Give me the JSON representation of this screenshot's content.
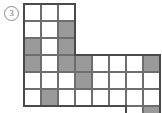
{
  "figure": {
    "label": "3",
    "label_name": "circled-figure-number",
    "type": "grid-polyomino-puzzle"
  },
  "grid": {
    "cell_size": 17,
    "origin_x": 24,
    "origin_y": 4,
    "columns": 8,
    "rows": 6,
    "line_color": "#6e6e6e",
    "outline_color": "#4a4a4a",
    "fill_color": "#9a9a9a",
    "empty_color": "#ffffff"
  },
  "chart_data": {
    "type": "heatmap",
    "title": "",
    "xlabel": "",
    "ylabel": "",
    "columns": 8,
    "rows": 6,
    "legend": [
      "empty",
      "shaded"
    ],
    "cells": [
      {
        "col": 0,
        "row": 0,
        "present": true,
        "filled": false
      },
      {
        "col": 1,
        "row": 0,
        "present": true,
        "filled": false
      },
      {
        "col": 2,
        "row": 0,
        "present": true,
        "filled": false
      },
      {
        "col": 3,
        "row": 0,
        "present": false,
        "filled": false
      },
      {
        "col": 4,
        "row": 0,
        "present": false,
        "filled": false
      },
      {
        "col": 5,
        "row": 0,
        "present": false,
        "filled": false
      },
      {
        "col": 6,
        "row": 0,
        "present": false,
        "filled": false
      },
      {
        "col": 7,
        "row": 0,
        "present": false,
        "filled": false
      },
      {
        "col": 0,
        "row": 1,
        "present": true,
        "filled": false
      },
      {
        "col": 1,
        "row": 1,
        "present": true,
        "filled": false
      },
      {
        "col": 2,
        "row": 1,
        "present": true,
        "filled": true
      },
      {
        "col": 3,
        "row": 1,
        "present": false,
        "filled": false
      },
      {
        "col": 4,
        "row": 1,
        "present": false,
        "filled": false
      },
      {
        "col": 5,
        "row": 1,
        "present": false,
        "filled": false
      },
      {
        "col": 6,
        "row": 1,
        "present": false,
        "filled": false
      },
      {
        "col": 7,
        "row": 1,
        "present": false,
        "filled": false
      },
      {
        "col": 0,
        "row": 2,
        "present": true,
        "filled": true
      },
      {
        "col": 1,
        "row": 2,
        "present": true,
        "filled": false
      },
      {
        "col": 2,
        "row": 2,
        "present": true,
        "filled": true
      },
      {
        "col": 3,
        "row": 2,
        "present": false,
        "filled": false
      },
      {
        "col": 4,
        "row": 2,
        "present": false,
        "filled": false
      },
      {
        "col": 5,
        "row": 2,
        "present": false,
        "filled": false
      },
      {
        "col": 6,
        "row": 2,
        "present": false,
        "filled": false
      },
      {
        "col": 7,
        "row": 2,
        "present": false,
        "filled": false
      },
      {
        "col": 0,
        "row": 3,
        "present": true,
        "filled": true
      },
      {
        "col": 1,
        "row": 3,
        "present": true,
        "filled": false
      },
      {
        "col": 2,
        "row": 3,
        "present": true,
        "filled": true
      },
      {
        "col": 3,
        "row": 3,
        "present": true,
        "filled": true
      },
      {
        "col": 4,
        "row": 3,
        "present": true,
        "filled": false
      },
      {
        "col": 5,
        "row": 3,
        "present": true,
        "filled": false
      },
      {
        "col": 6,
        "row": 3,
        "present": true,
        "filled": false
      },
      {
        "col": 7,
        "row": 3,
        "present": true,
        "filled": true
      },
      {
        "col": 0,
        "row": 4,
        "present": true,
        "filled": false
      },
      {
        "col": 1,
        "row": 4,
        "present": true,
        "filled": false
      },
      {
        "col": 2,
        "row": 4,
        "present": true,
        "filled": false
      },
      {
        "col": 3,
        "row": 4,
        "present": true,
        "filled": true
      },
      {
        "col": 4,
        "row": 4,
        "present": true,
        "filled": false
      },
      {
        "col": 5,
        "row": 4,
        "present": true,
        "filled": false
      },
      {
        "col": 6,
        "row": 4,
        "present": true,
        "filled": false
      },
      {
        "col": 7,
        "row": 4,
        "present": true,
        "filled": false
      },
      {
        "col": 0,
        "row": 5,
        "present": true,
        "filled": false
      },
      {
        "col": 1,
        "row": 5,
        "present": true,
        "filled": true
      },
      {
        "col": 2,
        "row": 5,
        "present": true,
        "filled": false
      },
      {
        "col": 3,
        "row": 5,
        "present": true,
        "filled": false
      },
      {
        "col": 4,
        "row": 5,
        "present": true,
        "filled": false
      },
      {
        "col": 5,
        "row": 5,
        "present": true,
        "filled": false
      },
      {
        "col": 6,
        "row": 5,
        "present": true,
        "filled": false
      },
      {
        "col": 7,
        "row": 5,
        "present": true,
        "filled": false
      },
      {
        "col": 6,
        "row": 6,
        "present": true,
        "filled": false
      },
      {
        "col": 7,
        "row": 6,
        "present": true,
        "filled": true
      },
      {
        "col": 6,
        "row": 7,
        "present": true,
        "filled": false
      },
      {
        "col": 7,
        "row": 7,
        "present": true,
        "filled": false
      }
    ]
  }
}
